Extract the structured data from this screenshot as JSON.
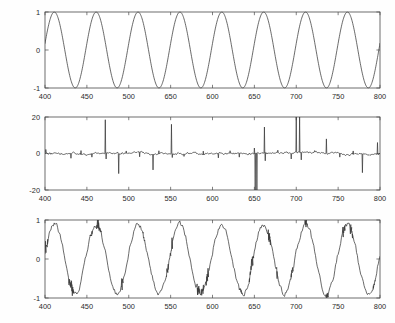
{
  "figure": {
    "title": "",
    "background_color": "#ffffff",
    "axis_color": "#4a4a4a",
    "trace_color": "#3a3a3a",
    "panel_count": 3
  },
  "chart_data": [
    {
      "type": "line",
      "title": "",
      "subtitle": "",
      "xlabel": "",
      "ylabel": "",
      "xlim": [
        400,
        800
      ],
      "ylim": [
        -1,
        1
      ],
      "grid": false,
      "legend": null,
      "xticks": [
        400,
        450,
        500,
        550,
        600,
        650,
        700,
        750,
        800
      ],
      "xticklabels": [
        "400",
        "450",
        "500",
        "650",
        "600",
        "650",
        "700",
        "750",
        "800"
      ],
      "yticks": [
        -1,
        0,
        1
      ],
      "yticklabels": [
        "-1",
        "0",
        "1"
      ],
      "description": "clean sinusoid, period 50 samples, amplitude 1",
      "series": [
        {
          "name": "clean sine",
          "waveform": "sine",
          "amplitude": 1.0,
          "period": 50,
          "phase_x0": 400,
          "phase_offset_deg": 10,
          "noise": 0
        }
      ]
    },
    {
      "type": "line",
      "title": "",
      "subtitle": "",
      "xlabel": "",
      "ylabel": "",
      "xlim": [
        400,
        800
      ],
      "ylim": [
        -20,
        20
      ],
      "grid": false,
      "legend": null,
      "xticks": [
        400,
        450,
        500,
        550,
        600,
        650,
        700,
        750,
        800
      ],
      "xticklabels": [
        "400",
        "450",
        "500",
        "550",
        "600",
        "650",
        "700",
        "750",
        "800"
      ],
      "yticks": [
        -20,
        0,
        20
      ],
      "yticklabels": [
        "-20",
        "0",
        "20"
      ],
      "description": "impulsive residual / error signal: low-level noise around zero with sparse large spikes",
      "series": [
        {
          "name": "residual",
          "waveform": "impulsive-noise",
          "baseline": 0,
          "noise_amplitude": 1.2,
          "spikes": [
            {
              "x": 401,
              "y": 2.2
            },
            {
              "x": 431,
              "y": -2.6
            },
            {
              "x": 443,
              "y": 1.6
            },
            {
              "x": 456,
              "y": -2.0
            },
            {
              "x": 472,
              "y": 18.5
            },
            {
              "x": 473,
              "y": -3.0
            },
            {
              "x": 488,
              "y": -11.0
            },
            {
              "x": 497,
              "y": 1.4
            },
            {
              "x": 513,
              "y": -1.8
            },
            {
              "x": 529,
              "y": -9.0
            },
            {
              "x": 536,
              "y": 1.5
            },
            {
              "x": 551,
              "y": 16.0
            },
            {
              "x": 552,
              "y": -2.2
            },
            {
              "x": 566,
              "y": -1.6
            },
            {
              "x": 589,
              "y": 1.3
            },
            {
              "x": 607,
              "y": -2.4
            },
            {
              "x": 621,
              "y": 1.5
            },
            {
              "x": 632,
              "y": -2.0
            },
            {
              "x": 650,
              "y": 3.0
            },
            {
              "x": 651,
              "y": -20.0
            },
            {
              "x": 653,
              "y": -20.0
            },
            {
              "x": 662,
              "y": 14.5
            },
            {
              "x": 663,
              "y": -4.0
            },
            {
              "x": 678,
              "y": 1.8
            },
            {
              "x": 694,
              "y": -3.0
            },
            {
              "x": 700,
              "y": 20.0
            },
            {
              "x": 704,
              "y": 20.0
            },
            {
              "x": 706,
              "y": -3.5
            },
            {
              "x": 722,
              "y": 1.6
            },
            {
              "x": 736,
              "y": 8.0
            },
            {
              "x": 752,
              "y": -2.0
            },
            {
              "x": 768,
              "y": 1.4
            },
            {
              "x": 779,
              "y": -10.5
            },
            {
              "x": 797,
              "y": 6.0
            }
          ]
        }
      ]
    },
    {
      "type": "line",
      "title": "",
      "subtitle": "",
      "xlabel": "",
      "ylabel": "",
      "xlim": [
        400,
        800
      ],
      "ylim": [
        -1,
        1
      ],
      "grid": false,
      "legend": null,
      "xticks": [
        400,
        450,
        500,
        550,
        600,
        650,
        700,
        750,
        800
      ],
      "xticklabels": [
        "400",
        "450",
        "500",
        "550",
        "600",
        "650",
        "700",
        "750",
        "800"
      ],
      "yticks": [
        -1,
        0,
        1
      ],
      "yticklabels": [
        "-1",
        "0",
        "1"
      ],
      "description": "noisy / distorted sinusoid, period ~50, amplitude ~0.88 with jagged glitches",
      "series": [
        {
          "name": "noisy sine",
          "waveform": "sine-with-noise",
          "amplitude": 0.88,
          "period": 50,
          "phase_x0": 400,
          "phase_offset_deg": 10,
          "noise": 0.07,
          "glitch_positions": [
            402,
            430,
            433,
            455,
            463,
            466,
            492,
            518,
            546,
            551,
            583,
            588,
            594,
            634,
            645,
            648,
            668,
            678,
            695,
            712,
            737,
            757,
            766,
            793
          ]
        }
      ]
    }
  ]
}
